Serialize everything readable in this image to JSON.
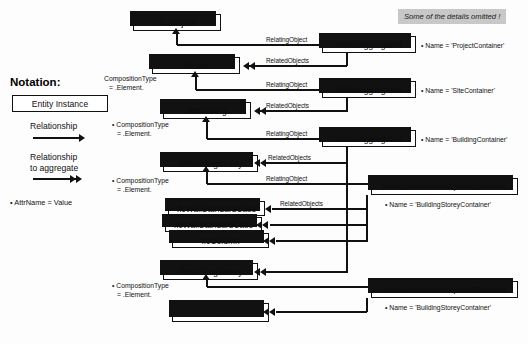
{
  "note": {
    "omitted": "Some of the details omitted !"
  },
  "legend": {
    "title": "Notation:",
    "entity_instance": "Entity Instance",
    "relationship": "Relationship",
    "relationship_aggregate_line1": "Relationship",
    "relationship_aggregate_line2": "to aggregate",
    "attribute_example": "• AttrName = Value"
  },
  "entities": {
    "project": "IfcProject",
    "site": "IfcSite",
    "building": "IfcBuilding",
    "storey1": "IfcBuildingStorey",
    "wall1": "IfcWallStandardCase",
    "wall2": "IfcWallStandardCase",
    "column": "IfcColumn",
    "storey2": "IfcBuildingStorey",
    "ellipsis": "..."
  },
  "relations": {
    "rel_agg_1": "IfcRelAggregates",
    "rel_agg_2": "IfcRelAggregates",
    "rel_agg_3": "IfcRelAggregates",
    "rel_contained_1": "IfcRelContainedInSpatialStructure",
    "rel_contained_2": "IfcRelContainedInSpatialStructure"
  },
  "rel_names": {
    "project_container": "• Name = 'ProjectContainer'",
    "site_container": "• Name = 'SiteContainer'",
    "building_container": "• Name = 'BuildingContainer'",
    "building_storey_container_1": "• Name = 'BuildingStoreyContainer'",
    "building_storey_container_2": "• Name = 'BuildingStoreyContainer'"
  },
  "edge_labels": {
    "relating_object_1": "RelatingObject",
    "related_objects_1": "RelatedObjects",
    "relating_object_2": "RelatingObject",
    "related_objects_2": "RelatedObjects",
    "relating_object_3": "RelatingObject",
    "related_objects_3": "RelatedObjects",
    "relating_object_4": "RelatingObject",
    "related_objects_4": "RelatedObjects"
  },
  "attributes": {
    "site_comp_l1": "CompositionType",
    "site_comp_l2": "= .Element.",
    "building_comp_l1": "• CompositionType",
    "building_comp_l2": "= .Element.",
    "storey1_comp_l1": "• CompositionType",
    "storey1_comp_l2": "= .Element.",
    "storey2_comp_l1": "• CompositionType",
    "storey2_comp_l2": "= .Element."
  }
}
